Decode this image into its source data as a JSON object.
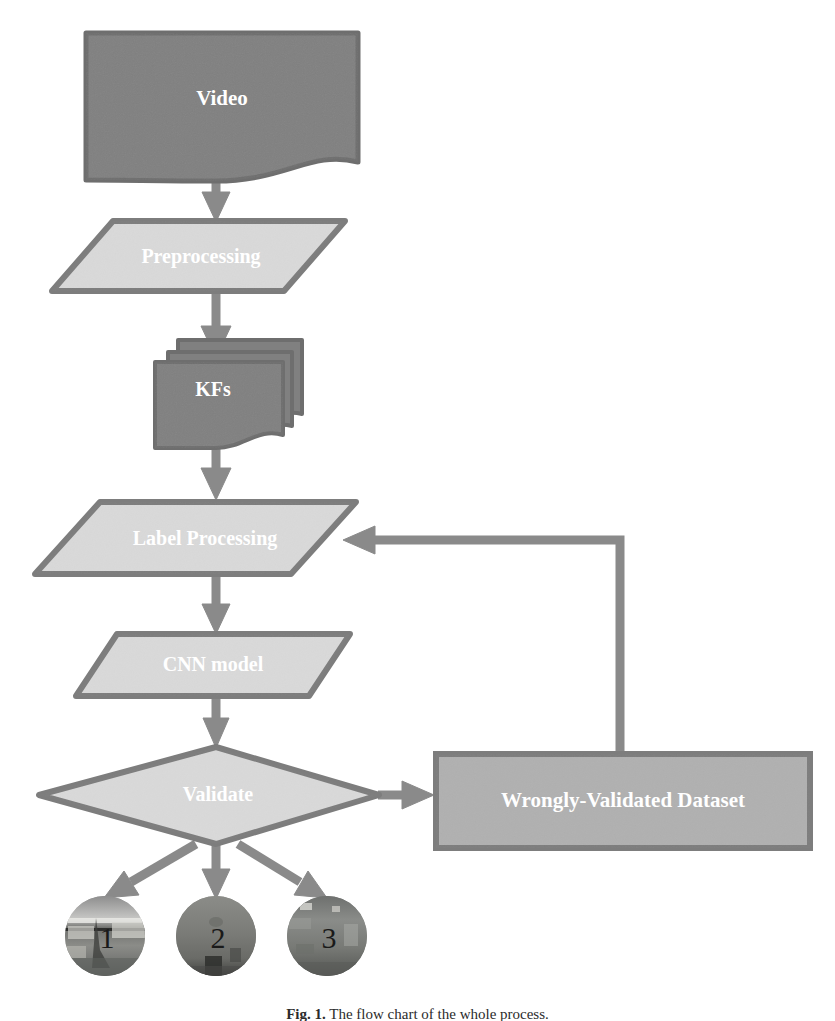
{
  "figure": {
    "caption_label": "Fig. 1.",
    "caption_body": "The flow chart of the whole process.",
    "background_color": "#ffffff"
  },
  "palette": {
    "dark_fill": "#808080",
    "dark_stroke": "#6e6e6e",
    "light_fill": "#d9d9d9",
    "light_stroke": "#7d7d7d",
    "medium_fill": "#b0b0b0",
    "medium_stroke": "#7d7d7d",
    "connector": "#8a8a8a",
    "label_text": "#ffffff",
    "number_text": "#1a1a1a"
  },
  "nodes": {
    "video": {
      "label": "Video",
      "shape": "document",
      "fill": "#808080",
      "font_size": 21
    },
    "preprocessing": {
      "label": "Preprocessing",
      "shape": "parallelogram",
      "fill": "#d9d9d9",
      "font_size": 20
    },
    "keyframes": {
      "label": "KFs",
      "shape": "multi-document",
      "fill": "#808080",
      "font_size": 20
    },
    "label_processing": {
      "label": "Label Processing",
      "shape": "parallelogram",
      "fill": "#d9d9d9",
      "font_size": 20
    },
    "cnn_model": {
      "label": "CNN model",
      "shape": "parallelogram",
      "fill": "#d9d9d9",
      "font_size": 20
    },
    "validate": {
      "label": "Validate",
      "shape": "diamond",
      "fill": "#d9d9d9",
      "font_size": 20
    },
    "wrongly_validated_dataset": {
      "label": "Wrongly-Validated Dataset",
      "shape": "rectangle",
      "fill": "#b0b0b0",
      "font_size": 21
    }
  },
  "outputs": {
    "items": [
      {
        "number": "1",
        "name": "output-class-1"
      },
      {
        "number": "2",
        "name": "output-class-2"
      },
      {
        "number": "3",
        "name": "output-class-3"
      }
    ],
    "font_size": 30
  },
  "connectors": [
    {
      "name": "video-to-preprocessing",
      "from": "video",
      "to": "preprocessing",
      "kind": "straight-down"
    },
    {
      "name": "preprocessing-to-keyframes",
      "from": "preprocessing",
      "to": "keyframes",
      "kind": "straight-down"
    },
    {
      "name": "keyframes-to-label-processing",
      "from": "keyframes",
      "to": "label_processing",
      "kind": "straight-down"
    },
    {
      "name": "label-processing-to-cnn-model",
      "from": "label_processing",
      "to": "cnn_model",
      "kind": "straight-down"
    },
    {
      "name": "cnn-model-to-validate",
      "from": "cnn_model",
      "to": "validate",
      "kind": "straight-down"
    },
    {
      "name": "validate-to-wrongly-validated-dataset",
      "from": "validate",
      "to": "wrongly_validated_dataset",
      "kind": "straight-right"
    },
    {
      "name": "feedback-to-label-processing",
      "from": "wrongly_validated_dataset",
      "to": "label_processing",
      "kind": "elbow-up-left"
    },
    {
      "name": "validate-to-output-1",
      "from": "validate",
      "to": "output-class-1",
      "kind": "diagonal-down-left"
    },
    {
      "name": "validate-to-output-2",
      "from": "validate",
      "to": "output-class-2",
      "kind": "straight-down"
    },
    {
      "name": "validate-to-output-3",
      "from": "validate",
      "to": "output-class-3",
      "kind": "diagonal-down-right"
    }
  ]
}
